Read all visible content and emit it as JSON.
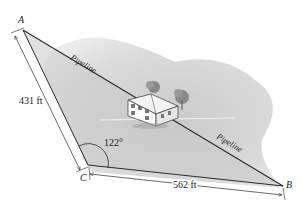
{
  "diagram": {
    "points": {
      "A": {
        "label": "A",
        "x": 23,
        "y": 30
      },
      "B": {
        "label": "B",
        "x": 283,
        "y": 186
      },
      "C": {
        "label": "C",
        "x": 88,
        "y": 165
      }
    },
    "sides": {
      "AC": {
        "label": "431 ft",
        "length_ft": 431
      },
      "CB": {
        "label": "562 ft",
        "length_ft": 562
      }
    },
    "angle_C": {
      "label": "122°",
      "degrees": 122
    },
    "pipeline_labels": [
      "Pipeline",
      "Pipeline"
    ],
    "colors": {
      "terrain": "#cfcfcf",
      "terrain_light": "#e2e2e2",
      "line": "#2a2a2a",
      "text": "#222222"
    }
  }
}
